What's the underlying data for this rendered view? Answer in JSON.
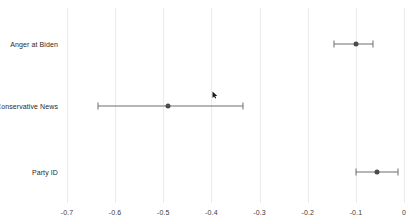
{
  "chart_data": {
    "type": "scatter",
    "title": "",
    "subtitle": "",
    "xlabel": "",
    "ylabel": "",
    "orientation": "horizontal",
    "plot_style": "coefficient-plot-with-confidence-intervals",
    "grid": true,
    "grid_axis": "x",
    "legend": false,
    "legend_position": "none",
    "xlim": [
      -0.7,
      0.0
    ],
    "xticks": [
      -0.7,
      -0.6,
      -0.5,
      -0.4,
      -0.3,
      -0.2,
      -0.1,
      0
    ],
    "xtick_labels": [
      "-0.7",
      "-0.6",
      "-0.5",
      "-0.4",
      "-0.3",
      "-0.2",
      "-0.1",
      "0"
    ],
    "categories": [
      "Anger at Biden",
      "Conservative News",
      "Party ID"
    ],
    "values": [
      -0.1,
      -0.49,
      -0.056
    ],
    "ci_low": [
      -0.145,
      -0.635,
      -0.1
    ],
    "ci_high": [
      -0.065,
      -0.335,
      -0.012
    ],
    "series": [
      {
        "name": "Coefficient estimate",
        "points": [
          {
            "category": "Anger at Biden",
            "estimate": -0.1,
            "ci_low": -0.145,
            "ci_high": -0.065
          },
          {
            "category": "Conservative News",
            "estimate": -0.49,
            "ci_low": -0.635,
            "ci_high": -0.335
          },
          {
            "category": "Party ID",
            "estimate": -0.056,
            "ci_low": -0.1,
            "ci_high": -0.012
          }
        ]
      }
    ],
    "colors": {
      "point": "#4c4c4c",
      "errorbar": "#6e6e6e",
      "gridline": "#ebebeb",
      "background": "#ffffff",
      "text": "#2b2b2b"
    }
  },
  "axis": {
    "ticks": [
      {
        "value": -0.7,
        "label": "-0.7"
      },
      {
        "value": -0.6,
        "label": "-0.6"
      },
      {
        "value": -0.5,
        "label": "-0.5"
      },
      {
        "value": -0.4,
        "label": "-0.4"
      },
      {
        "value": -0.3,
        "label": "-0.3"
      },
      {
        "value": -0.2,
        "label": "-0.2"
      },
      {
        "value": -0.1,
        "label": "-0.1"
      },
      {
        "value": 0,
        "label": "0"
      }
    ]
  },
  "rows": [
    {
      "label": "Anger at Biden"
    },
    {
      "label": "Conservative News"
    },
    {
      "label": "Party ID"
    }
  ],
  "cursor": {
    "name": "mouse-pointer",
    "x": 215,
    "y": 95
  }
}
